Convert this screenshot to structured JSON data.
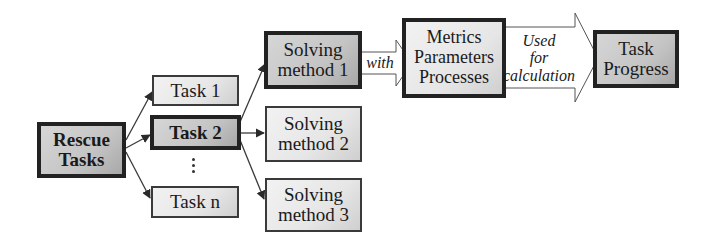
{
  "diagram": {
    "root": {
      "lines": [
        "Rescue",
        "Tasks"
      ]
    },
    "tasks": [
      {
        "label": "Task 1"
      },
      {
        "label": "Task 2"
      },
      {
        "label": "Task n"
      }
    ],
    "ellipsis": "⋮",
    "methods": [
      {
        "lines": [
          "Solving",
          "method 1"
        ]
      },
      {
        "lines": [
          "Solving",
          "method 2"
        ]
      },
      {
        "lines": [
          "Solving",
          "method 3"
        ]
      }
    ],
    "with_arrow": {
      "label": "with"
    },
    "metrics": {
      "lines": [
        "Metrics",
        "Parameters",
        "Processes"
      ]
    },
    "calc_arrow": {
      "lines": [
        "Used",
        "for",
        "calculation"
      ]
    },
    "result": {
      "lines": [
        "Task",
        "Progress"
      ]
    },
    "colors": {
      "border_dark": "#222222",
      "border": "#3a3a3a",
      "fill_light": "#ececec",
      "fill_dark": "#a9a9a9",
      "arrow_line": "#333333"
    }
  }
}
